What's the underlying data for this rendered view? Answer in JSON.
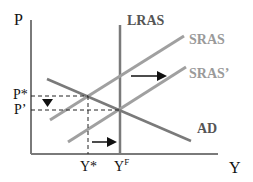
{
  "diagram": {
    "type": "AS-AD model",
    "axes": {
      "y_label": "P",
      "x_label": "Y"
    },
    "curves": {
      "lras": "LRAS",
      "sras": "SRAS",
      "sras_shifted": "SRAS’",
      "ad": "AD"
    },
    "price_levels": {
      "initial": "P*",
      "new": "P’"
    },
    "output_levels": {
      "initial": "Y*",
      "full": "Y",
      "full_sup": "F"
    },
    "colors": {
      "axis": "#7a7a7a",
      "curve": "#8c8c8c",
      "arrow": "#111111",
      "dashed": "#222222"
    }
  }
}
